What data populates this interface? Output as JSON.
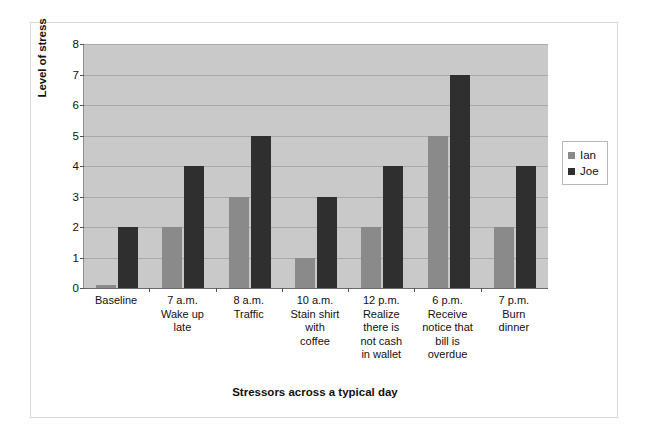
{
  "chart_data": {
    "type": "bar",
    "title": "",
    "xlabel": "Stressors across a typical day",
    "ylabel": "Level of stress",
    "ylim": [
      0,
      8
    ],
    "yticks": [
      8,
      7,
      6,
      5,
      4,
      3,
      2,
      1,
      0
    ],
    "grid": true,
    "legend_position": "right",
    "categories": [
      "Baseline",
      "7 a.m.\nWake up\nlate",
      "8 a.m.\nTraffic",
      "10 a.m.\nStain shirt\nwith\ncoffee",
      "12 p.m.\nRealize\nthere is\nnot cash\nin wallet",
      "6 p.m.\nReceive\nnotice that\nbill is\noverdue",
      "7 p.m.\nBurn\ndinner"
    ],
    "series": [
      {
        "name": "Ian",
        "color": "#8a8a8a",
        "values": [
          0.1,
          2,
          3,
          1,
          2,
          5,
          2
        ]
      },
      {
        "name": "Joe",
        "color": "#2f2f2f",
        "values": [
          2,
          4,
          5,
          3,
          4,
          7,
          4
        ]
      }
    ]
  },
  "legend": {
    "entries": [
      {
        "label": "Ian",
        "color": "#8a8a8a"
      },
      {
        "label": "Joe",
        "color": "#2f2f2f"
      }
    ]
  },
  "colors": {
    "plot_background": "#c9c9c9",
    "gridline": "#a9a9a9",
    "page_background": "#ffffff",
    "frame_border": "#d8d8d8",
    "text": "#111111"
  }
}
